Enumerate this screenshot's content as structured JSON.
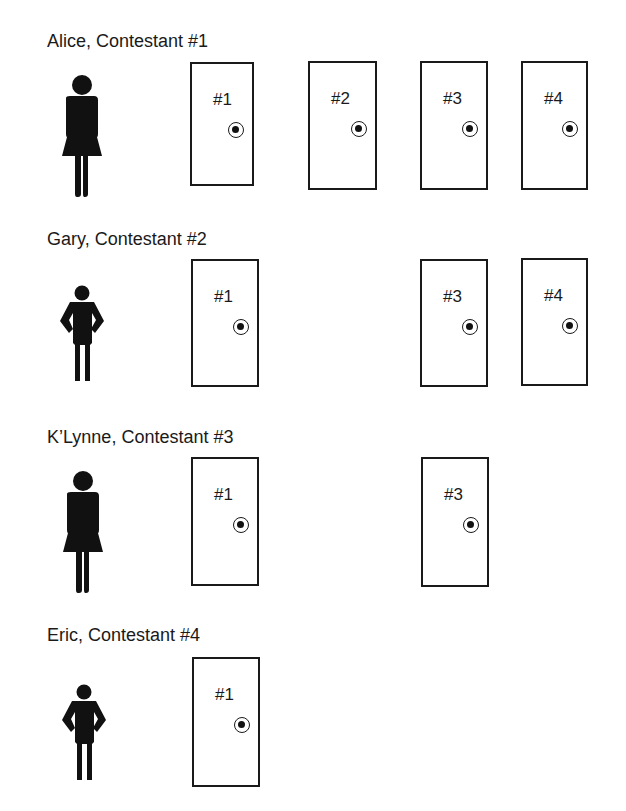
{
  "contestants": [
    {
      "label": "Alice, Contestant #1",
      "figure": "woman-icon",
      "doors": [
        {
          "label": "#1"
        },
        {
          "label": "#2"
        },
        {
          "label": "#3"
        },
        {
          "label": "#4"
        }
      ]
    },
    {
      "label": "Gary, Contestant #2",
      "figure": "man-icon",
      "doors": [
        {
          "label": "#1"
        },
        {
          "label": "#3"
        },
        {
          "label": "#4"
        }
      ]
    },
    {
      "label": "K’Lynne, Contestant #3",
      "figure": "woman-icon",
      "doors": [
        {
          "label": "#1"
        },
        {
          "label": "#3"
        }
      ]
    },
    {
      "label": "Eric, Contestant #4",
      "figure": "man-icon",
      "doors": [
        {
          "label": "#1"
        }
      ]
    }
  ],
  "colors": {
    "ink": "#1a1a1a",
    "background": "#ffffff"
  }
}
